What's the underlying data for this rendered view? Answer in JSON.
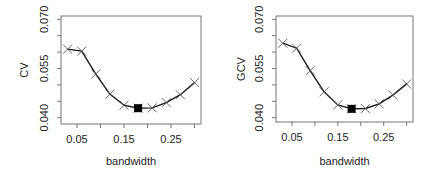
{
  "chart_data": [
    {
      "type": "line",
      "title": "",
      "xlabel": "bandwidth",
      "ylabel": "CV",
      "xlim": [
        0.02,
        0.31
      ],
      "ylim": [
        0.04,
        0.07
      ],
      "x_ticks": [
        "0.05",
        "0.15",
        "0.25"
      ],
      "y_ticks": [
        "0.040",
        "0.055",
        "0.070"
      ],
      "grid": false,
      "legend": null,
      "marker": "x",
      "x": [
        0.03,
        0.06,
        0.09,
        0.12,
        0.15,
        0.18,
        0.21,
        0.24,
        0.27,
        0.3
      ],
      "values": [
        0.0609,
        0.0603,
        0.0533,
        0.0472,
        0.0438,
        0.0429,
        0.043,
        0.0446,
        0.047,
        0.0507
      ],
      "minimum": {
        "x": 0.18,
        "y": 0.0429,
        "marker": "filled-square"
      }
    },
    {
      "type": "line",
      "title": "",
      "xlabel": "bandwidth",
      "ylabel": "GCV",
      "xlim": [
        0.02,
        0.31
      ],
      "ylim": [
        0.04,
        0.07
      ],
      "x_ticks": [
        "0.05",
        "0.15",
        "0.25"
      ],
      "y_ticks": [
        "0.040",
        "0.055",
        "0.070"
      ],
      "grid": false,
      "legend": null,
      "marker": "x",
      "x": [
        0.03,
        0.06,
        0.09,
        0.12,
        0.15,
        0.18,
        0.21,
        0.24,
        0.27,
        0.3
      ],
      "values": [
        0.0627,
        0.0612,
        0.0543,
        0.0479,
        0.0439,
        0.0427,
        0.0428,
        0.0442,
        0.0469,
        0.0503
      ],
      "minimum": {
        "x": 0.18,
        "y": 0.0427,
        "marker": "filled-square"
      }
    }
  ],
  "colors": {
    "line": "#1a1a1a",
    "marker": "#555555",
    "box": "#777777",
    "text": "#222222",
    "min_marker": "#000000"
  }
}
